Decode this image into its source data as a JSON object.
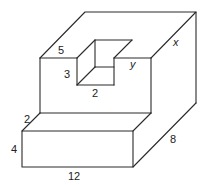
{
  "diagram": {
    "type": "3d-solid-with-notch",
    "labels": {
      "notch_depth": "5",
      "notch_height": "3",
      "notch_width": "2",
      "upper_unknown_y": "y",
      "depth_unknown_x": "x",
      "step_depth": "2",
      "lower_height": "4",
      "front_length": "12",
      "side_depth": "8"
    },
    "stroke_color": "#2a2a2a",
    "background": "#ffffff"
  }
}
